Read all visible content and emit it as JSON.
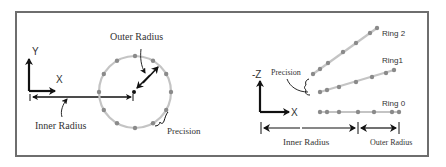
{
  "left_panel": {
    "axis_y_label": "Y",
    "axis_x_label": "X",
    "outer_radius_label": "Outer Radius",
    "inner_radius_label": "Inner Radius",
    "precision_label": "Precision",
    "circle_dot_count": 12
  },
  "right_panel": {
    "axis_z_label": "-Z",
    "axis_x_label": "X",
    "precision_label": "Precision",
    "rings": [
      {
        "label": "Ring 2"
      },
      {
        "label": "Ring1"
      },
      {
        "label": "Ring 0"
      }
    ],
    "inner_radius_label": "Inner Radius",
    "outer_radius_label": "Outer Radius"
  },
  "colors": {
    "frame": "#6e6e6e",
    "ring_line": "#c4c4c4",
    "dot": "#8a8a8a",
    "ink": "#111111"
  }
}
